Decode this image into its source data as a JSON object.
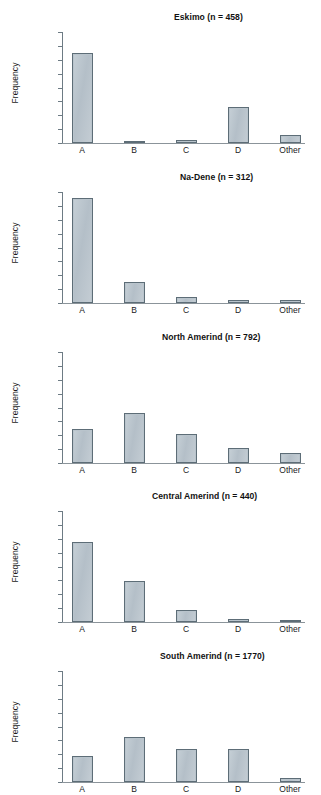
{
  "figure": {
    "ylabel": "Frequency",
    "y_ticks": [
      "0.8",
      "0.7",
      "0.6",
      "0.5",
      "0.4",
      "0.3",
      "0.2",
      "0.1",
      "0"
    ],
    "categories": [
      "A",
      "B",
      "C",
      "D",
      "Other"
    ]
  },
  "chart_data": [
    {
      "type": "bar",
      "title": "Eskimo (n = 458)",
      "categories": [
        "A",
        "B",
        "C",
        "D",
        "Other"
      ],
      "values": [
        0.65,
        0.01,
        0.025,
        0.26,
        0.055
      ],
      "xlabel": "",
      "ylabel": "Frequency",
      "ylim": [
        0,
        0.8
      ],
      "yticks": [
        0,
        0.1,
        0.2,
        0.3,
        0.4,
        0.5,
        0.6,
        0.7,
        0.8
      ],
      "grid": false,
      "legend": "none",
      "n": 458
    },
    {
      "type": "bar",
      "title": "Na-Dene (n = 312)",
      "categories": [
        "A",
        "B",
        "C",
        "D",
        "Other"
      ],
      "values": [
        0.755,
        0.15,
        0.045,
        0.025,
        0.025
      ],
      "xlabel": "",
      "ylabel": "Frequency",
      "ylim": [
        0,
        0.8
      ],
      "yticks": [
        0,
        0.1,
        0.2,
        0.3,
        0.4,
        0.5,
        0.6,
        0.7,
        0.8
      ],
      "grid": false,
      "legend": "none",
      "n": 312
    },
    {
      "type": "bar",
      "title": "North Amerind (n = 792)",
      "categories": [
        "A",
        "B",
        "C",
        "D",
        "Other"
      ],
      "values": [
        0.245,
        0.36,
        0.21,
        0.11,
        0.07
      ],
      "xlabel": "",
      "ylabel": "Frequency",
      "ylim": [
        0,
        0.8
      ],
      "yticks": [
        0,
        0.1,
        0.2,
        0.3,
        0.4,
        0.5,
        0.6,
        0.7,
        0.8
      ],
      "grid": false,
      "legend": "none",
      "n": 792
    },
    {
      "type": "bar",
      "title": "Central Amerind (n = 440)",
      "categories": [
        "A",
        "B",
        "C",
        "D",
        "Other"
      ],
      "values": [
        0.575,
        0.295,
        0.09,
        0.025,
        0.008
      ],
      "xlabel": "",
      "ylabel": "Frequency",
      "ylim": [
        0,
        0.8
      ],
      "yticks": [
        0,
        0.1,
        0.2,
        0.3,
        0.4,
        0.5,
        0.6,
        0.7,
        0.8
      ],
      "grid": false,
      "legend": "none",
      "n": 440
    },
    {
      "type": "bar",
      "title": "South Amerind (n = 1770)",
      "categories": [
        "A",
        "B",
        "C",
        "D",
        "Other"
      ],
      "values": [
        0.19,
        0.325,
        0.235,
        0.24,
        0.03
      ],
      "xlabel": "",
      "ylabel": "Frequency",
      "ylim": [
        0,
        0.8
      ],
      "yticks": [
        0,
        0.1,
        0.2,
        0.3,
        0.4,
        0.5,
        0.6,
        0.7,
        0.8
      ],
      "grid": false,
      "legend": "none",
      "n": 1770
    }
  ],
  "style": {
    "bar_fill": "#b9c4cc",
    "bar_stroke": "#5d6d77",
    "axis_color": "#6d7b84",
    "text_color": "#1a1a1a"
  }
}
